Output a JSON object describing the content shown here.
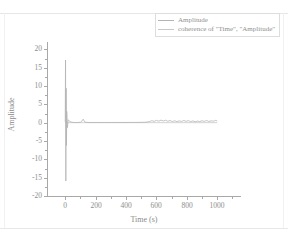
{
  "chart_data": {
    "type": "line",
    "title": "",
    "xlabel": "Time (s)",
    "ylabel": "Amplitude",
    "xlim": [
      -120,
      1150
    ],
    "ylim": [
      -20,
      22
    ],
    "grid": false,
    "legend_position": "top-right",
    "xticks": [
      0,
      200,
      400,
      600,
      800,
      1000
    ],
    "yticks": [
      20,
      15,
      10,
      5,
      0,
      -5,
      -10,
      -15,
      -20
    ],
    "xtick_labels": [
      "0",
      "200",
      "400",
      "600",
      "800",
      "1000"
    ],
    "ytick_labels": [
      "20",
      "15",
      "10",
      "5",
      "0",
      "-5",
      "-10",
      "-15",
      "-20"
    ],
    "series": [
      {
        "name": "Amplitude",
        "color": "#b4b4b4",
        "x": [
          0,
          2,
          4,
          6,
          8,
          10,
          14,
          20,
          30,
          45,
          60,
          80,
          100,
          110,
          118,
          124,
          130,
          140,
          160,
          190,
          220,
          260,
          300,
          340,
          380,
          420,
          460,
          500,
          530,
          555,
          570,
          585,
          600,
          615,
          630,
          645,
          660,
          675,
          690,
          705,
          720,
          735,
          750,
          765,
          780,
          795,
          810,
          825,
          840,
          855,
          870,
          885,
          900,
          915,
          930,
          945,
          960,
          975,
          990,
          1000
        ],
        "y": [
          0.2,
          17.1,
          -15.9,
          9.4,
          -6.2,
          3.1,
          -1.4,
          0.8,
          0.3,
          0.1,
          0.05,
          0.05,
          0.1,
          0.45,
          0.95,
          0.5,
          0.15,
          0.08,
          0.05,
          0.05,
          0.05,
          0.05,
          0.05,
          0.05,
          0.05,
          0.06,
          0.07,
          0.09,
          0.12,
          0.3,
          0.55,
          0.35,
          0.62,
          0.4,
          0.7,
          0.45,
          0.66,
          0.38,
          0.58,
          0.3,
          0.52,
          0.28,
          0.5,
          0.33,
          0.6,
          0.36,
          0.55,
          0.3,
          0.48,
          0.26,
          0.44,
          0.3,
          0.52,
          0.35,
          0.58,
          0.32,
          0.5,
          0.4,
          0.62,
          0.45
        ]
      },
      {
        "name": "coherence of \"Time\", \"Amplitude\"",
        "color": "#c8c8c8",
        "x": [
          0,
          50,
          120,
          200,
          300,
          400,
          500,
          600,
          700,
          800,
          900,
          1000
        ],
        "y": [
          0.0,
          0.0,
          0.0,
          0.0,
          0.0,
          0.0,
          0.0,
          0.0,
          0.0,
          0.0,
          0.0,
          0.0
        ]
      }
    ],
    "peak_spike": {
      "x": 2,
      "y_max": 17.1,
      "y_min": -15.9
    }
  },
  "legend": {
    "items": [
      {
        "label": "Amplitude"
      },
      {
        "label": "coherence of \"Time\", \"Amplitude\""
      }
    ]
  },
  "axes": {
    "x_title": "Time (s)",
    "y_title": "Amplitude"
  },
  "colors": {
    "background": "#ffffff",
    "axis": "#a8a8a8",
    "text": "#8d8d8d",
    "series_1": "#b4b4b4",
    "series_2": "#c8c8c8",
    "legend_border": "#dddddd"
  }
}
